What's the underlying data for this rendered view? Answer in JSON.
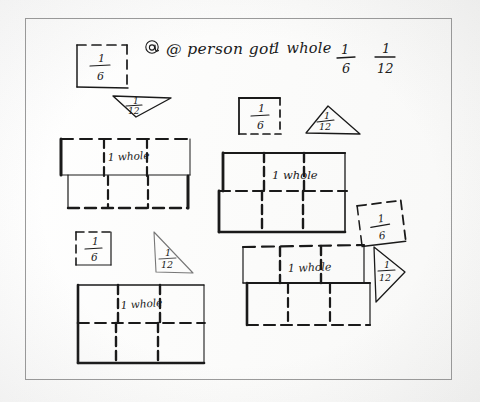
{
  "document": {
    "kind": "handwritten-math-worksheet-scan",
    "background_color": "#fdfdfc",
    "ink_color": "#1a1a1a",
    "border_color": "#9a9a9a",
    "title": "@ person got  1 whole  1/6  1/12",
    "title_parts": {
      "prefix": "@ person got",
      "whole": "1 whole",
      "fraction_one_numerator": "1",
      "fraction_one_denominator": "6",
      "fraction_two_numerator": "1",
      "fraction_two_denominator": "12"
    }
  },
  "labels": {
    "whole": "1 whole",
    "one_sixth_num": "1",
    "one_sixth_den": "6",
    "one_twelfth_num": "1",
    "one_twelfth_den": "12"
  },
  "groups": [
    {
      "id": "group-top-left",
      "name": "one-sixth-square-and-one-twelfth-triangle-top-left",
      "square_label": "1/6",
      "triangle_label": "1/12"
    },
    {
      "id": "group-top-right",
      "name": "one-sixth-square-and-one-twelfth-triangle-top-right",
      "square_label": "1/6",
      "triangle_label": "1/12"
    },
    {
      "id": "group-mid-left",
      "name": "one-whole-rectangle-upper-left",
      "rectangle_label": "1 whole",
      "columns": 3,
      "rows": 2
    },
    {
      "id": "group-mid-right",
      "name": "one-whole-rectangle-upper-right",
      "rectangle_label": "1 whole",
      "columns": 3,
      "rows": 2
    },
    {
      "id": "group-lower-left-fractions",
      "name": "one-sixth-square-and-one-twelfth-triangle-lower-left",
      "square_label": "1/6",
      "triangle_label": "1/12"
    },
    {
      "id": "group-lower-left-whole",
      "name": "one-whole-rectangle-lower-left",
      "rectangle_label": "1 whole",
      "columns": 3,
      "rows": 2
    },
    {
      "id": "group-right-fractions",
      "name": "one-sixth-square-and-one-twelfth-triangle-right",
      "square_label": "1/6",
      "triangle_label": "1/12"
    },
    {
      "id": "group-lower-right-whole",
      "name": "one-whole-rectangle-lower-right",
      "rectangle_label": "1 whole",
      "columns": 3,
      "rows": 2
    }
  ]
}
